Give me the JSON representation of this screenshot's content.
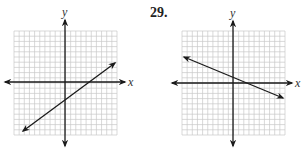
{
  "problem_number": "29.",
  "graphs": [
    {
      "id": "graph-left",
      "x_label": "x",
      "y_label": "y",
      "grid": {
        "left": 14,
        "top": 31,
        "right": 117,
        "bottom": 135,
        "cells": 20
      },
      "axes": {
        "x_axis_y": 82,
        "y_axis_x": 65,
        "x_arrow_left": 5,
        "x_arrow_right": 125,
        "y_arrow_top": 20,
        "y_arrow_bottom": 146
      },
      "line": {
        "x1": 23,
        "y1": 131,
        "x2": 115,
        "y2": 63,
        "description": "increasing line, positive slope"
      }
    },
    {
      "id": "graph-right",
      "x_label": "x",
      "y_label": "y",
      "grid": {
        "left": 182,
        "top": 31,
        "right": 285,
        "bottom": 135,
        "cells": 20
      },
      "axes": {
        "x_axis_y": 83,
        "y_axis_x": 233,
        "x_arrow_left": 172,
        "x_arrow_right": 292,
        "y_arrow_top": 21,
        "y_arrow_bottom": 146
      },
      "line": {
        "x1": 184,
        "y1": 57,
        "x2": 283,
        "y2": 98,
        "description": "decreasing line, negative slope"
      }
    }
  ],
  "colors": {
    "grid": "#c8c8c8",
    "axis": "#1a1a1a",
    "line": "#1a1a1a"
  }
}
